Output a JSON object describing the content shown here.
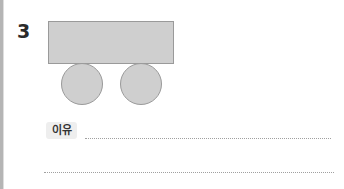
{
  "question": {
    "number": "3",
    "figure": {
      "body": {
        "shape": "rectangle",
        "fill": "#cfcfcf",
        "stroke": "#9a9a9a"
      },
      "wheels": [
        {
          "shape": "circle",
          "fill": "#cfcfcf"
        },
        {
          "shape": "circle",
          "fill": "#cfcfcf"
        }
      ]
    },
    "reason_label": "이유",
    "answer_lines": [
      {
        "value": ""
      },
      {
        "value": ""
      }
    ]
  }
}
